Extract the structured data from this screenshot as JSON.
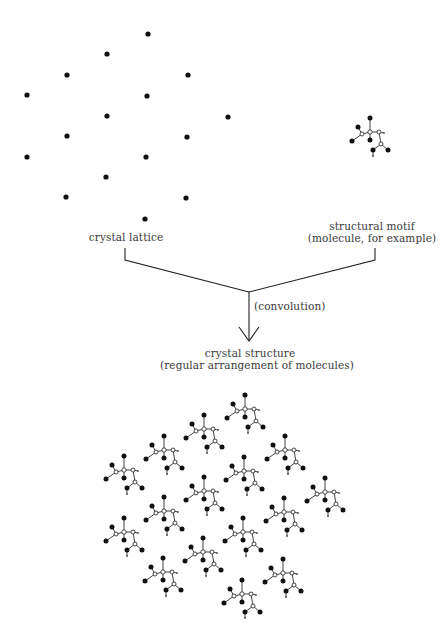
{
  "labels": {
    "lattice": "crystal lattice",
    "motif_line1": "structural motif",
    "motif_line2": "(molecule, for example)",
    "operation": "(convolution)",
    "structure_line1": "crystal structure",
    "structure_line2": "(regular arrangement of molecules)"
  },
  "lattice_points": [
    [
      148,
      34
    ],
    [
      107,
      54
    ],
    [
      67,
      75
    ],
    [
      188,
      75
    ],
    [
      27,
      95
    ],
    [
      147,
      96
    ],
    [
      107,
      116
    ],
    [
      228,
      117
    ],
    [
      67,
      136
    ],
    [
      187,
      137
    ],
    [
      27,
      157
    ],
    [
      146,
      157
    ],
    [
      106,
      177
    ],
    [
      66,
      197
    ],
    [
      186,
      198
    ],
    [
      145,
      219
    ]
  ],
  "motif_position": [
    370,
    118
  ],
  "structure_offset": [
    97,
    361
  ],
  "colors": {
    "ink": "#111111",
    "line": "#222222",
    "text": "#3a3a3a"
  }
}
